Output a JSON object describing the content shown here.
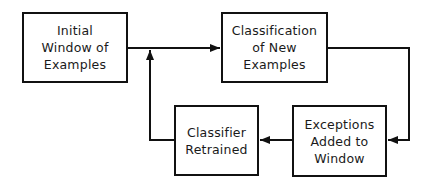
{
  "diagram": {
    "type": "flowchart",
    "nodes": [
      {
        "id": "initial",
        "label": "Initial\nWindow of\nExamples"
      },
      {
        "id": "classify",
        "label": "Classification\nof New\nExamples"
      },
      {
        "id": "retrained",
        "label": "Classifier\nRetrained"
      },
      {
        "id": "exceptions",
        "label": "Exceptions\nAdded to\nWindow"
      }
    ],
    "edges": [
      {
        "from": "initial",
        "to": "classify"
      },
      {
        "from": "classify",
        "to": "exceptions"
      },
      {
        "from": "exceptions",
        "to": "retrained"
      },
      {
        "from": "retrained",
        "to": "classify",
        "via": "junction on initial→classify line"
      }
    ],
    "colors": {
      "stroke": "#111111",
      "background": "#ffffff",
      "text": "#1a1a1a"
    }
  }
}
